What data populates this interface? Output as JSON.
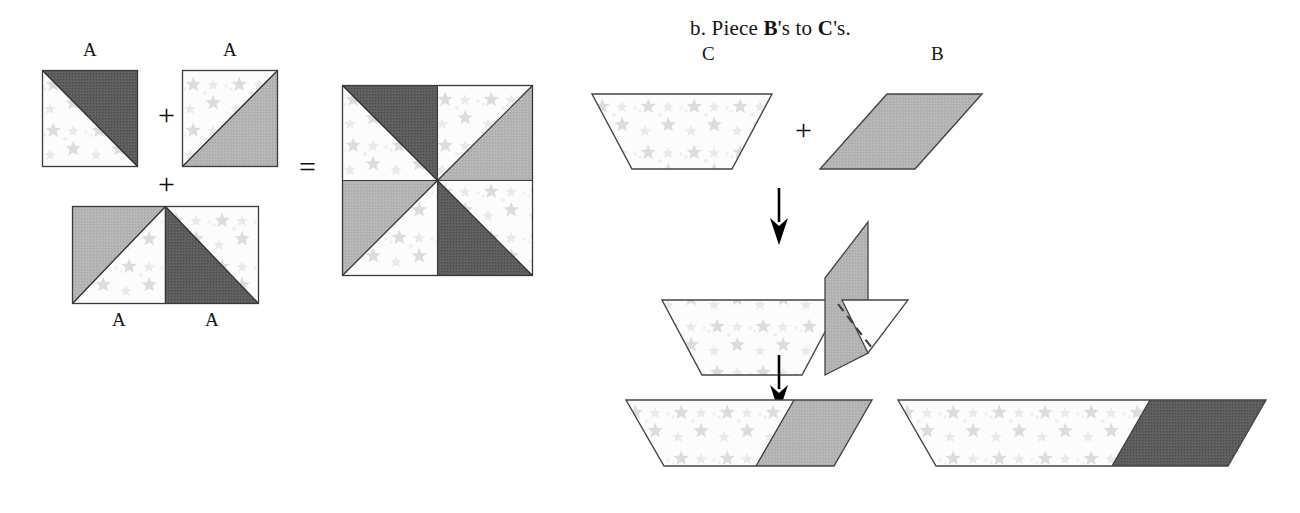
{
  "figure": {
    "heading_prefix": "b. Piece ",
    "heading_b": "B",
    "heading_mid": "'s to ",
    "heading_c": "C",
    "heading_suffix": "'s."
  },
  "colors": {
    "dark_gray": "#595959",
    "medium_gray": "#b2b2b2",
    "light_print": "#fbfbfb",
    "star_print": "#dededd",
    "outline": "#333333",
    "arrow": "#000000"
  },
  "left_diagram": {
    "operator_plus_1": "+",
    "operator_plus_2": "+",
    "operator_equals": "=",
    "pieces": [
      {
        "label": "A",
        "name": "square-a-top-left",
        "shade": "dark",
        "corner": "upper-right"
      },
      {
        "label": "A",
        "name": "square-a-top-right",
        "shade": "medium",
        "corner": "lower-right"
      },
      {
        "label": "A",
        "name": "square-a-bottom-left",
        "shade": "medium",
        "corner": "upper-left"
      },
      {
        "label": "A",
        "name": "square-a-bottom-right",
        "shade": "dark",
        "corner": "lower-left"
      }
    ],
    "result": {
      "name": "pinwheel-block",
      "description": "pinwheel block of four A squares"
    }
  },
  "right_diagram": {
    "operator_plus": "+",
    "step1": {
      "piece_c_label": "C",
      "piece_b_label": "B",
      "piece_c_shape": "trapezoid",
      "piece_b_shape": "parallelogram",
      "piece_b_shade": "medium"
    },
    "step2": {
      "description": "B flipped up and pinned to C with stitching line"
    },
    "step3": {
      "unit_left_shade": "medium",
      "unit_right_shade": "dark"
    },
    "arrows": [
      "down-arrow-1",
      "down-arrow-2"
    ]
  }
}
